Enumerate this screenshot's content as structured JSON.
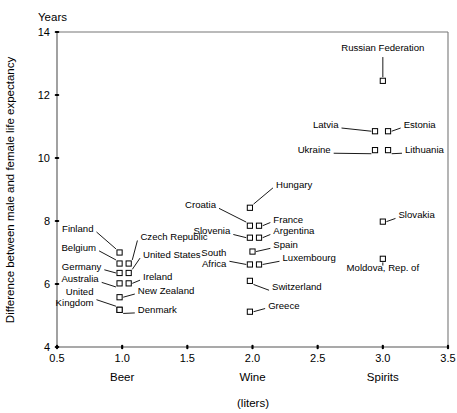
{
  "chart_data": {
    "type": "scatter",
    "title": "",
    "ylabel": "Difference between male and female life expectancy",
    "yunit": "Years",
    "xlabel": "",
    "xunit": "(liters)",
    "xlim": [
      0.5,
      3.5
    ],
    "ylim": [
      4,
      14
    ],
    "xticks": [
      "0.5",
      "1.0",
      "1.5",
      "2.0",
      "2.5",
      "3.0",
      "3.5"
    ],
    "xtickvals": [
      0.5,
      1.0,
      1.5,
      2.0,
      2.5,
      3.0,
      3.5
    ],
    "yticks": [
      "4",
      "6",
      "8",
      "10",
      "12",
      "14"
    ],
    "ytickvals": [
      4,
      6,
      8,
      10,
      12,
      14
    ],
    "grid": false,
    "legend": false,
    "category_labels": [
      {
        "text": "Beer",
        "x": 1.0
      },
      {
        "text": "Wine",
        "x": 2.0
      },
      {
        "text": "Spirits",
        "x": 3.0
      }
    ],
    "points": [
      {
        "name": "Russian Federation",
        "x": 3.0,
        "y": 12.45,
        "label_x": 3.0,
        "label_y": 13.3,
        "anchor": "middle",
        "leader": "v"
      },
      {
        "name": "Latvia",
        "x": 2.94,
        "y": 10.85,
        "label_x": 2.66,
        "label_y": 10.85,
        "anchor": "end",
        "leader": "h"
      },
      {
        "name": "Estonia",
        "x": 3.04,
        "y": 10.85,
        "label_x": 3.16,
        "label_y": 10.85,
        "anchor": "start",
        "leader": "h"
      },
      {
        "name": "Ukraine",
        "x": 2.94,
        "y": 10.25,
        "label_x": 2.6,
        "label_y": 10.05,
        "anchor": "end",
        "leader": "d"
      },
      {
        "name": "Lithuania",
        "x": 3.04,
        "y": 10.25,
        "label_x": 3.17,
        "label_y": 10.05,
        "anchor": "start",
        "leader": "d"
      },
      {
        "name": "Slovakia",
        "x": 3.0,
        "y": 7.98,
        "label_x": 3.12,
        "label_y": 7.98,
        "anchor": "start",
        "leader": "h"
      },
      {
        "name": "Moldova, Rep. of",
        "x": 3.0,
        "y": 6.8,
        "label_x": 3.0,
        "label_y": 6.3,
        "anchor": "middle",
        "leader": "v"
      },
      {
        "name": "Hungary",
        "x": 1.98,
        "y": 8.42,
        "label_x": 2.18,
        "label_y": 8.95,
        "anchor": "start",
        "leader": "d"
      },
      {
        "name": "Croatia",
        "x": 1.98,
        "y": 7.85,
        "label_x": 1.72,
        "label_y": 8.3,
        "anchor": "end",
        "leader": "d"
      },
      {
        "name": "France",
        "x": 2.05,
        "y": 7.85,
        "label_x": 2.16,
        "label_y": 7.85,
        "anchor": "start",
        "leader": "h"
      },
      {
        "name": "Slovenia",
        "x": 1.98,
        "y": 7.47,
        "label_x": 1.83,
        "label_y": 7.47,
        "anchor": "end",
        "leader": "h"
      },
      {
        "name": "Argentina",
        "x": 2.05,
        "y": 7.47,
        "label_x": 2.16,
        "label_y": 7.47,
        "anchor": "start",
        "leader": "h"
      },
      {
        "name": "Spain",
        "x": 2.0,
        "y": 7.03,
        "label_x": 2.16,
        "label_y": 7.03,
        "anchor": "start",
        "leader": "h"
      },
      {
        "name": "South Africa",
        "x": 1.98,
        "y": 6.62,
        "label_x": 1.8,
        "label_y": 6.62,
        "anchor": "end",
        "leader": "h"
      },
      {
        "name": "Luxembourg",
        "x": 2.05,
        "y": 6.62,
        "label_x": 2.23,
        "label_y": 6.62,
        "anchor": "start",
        "leader": "h"
      },
      {
        "name": "Switzerland",
        "x": 1.98,
        "y": 6.1,
        "label_x": 2.15,
        "label_y": 5.7,
        "anchor": "start",
        "leader": "d"
      },
      {
        "name": "Greece",
        "x": 1.98,
        "y": 5.12,
        "label_x": 2.12,
        "label_y": 5.12,
        "anchor": "start",
        "leader": "h"
      },
      {
        "name": "Finland",
        "x": 0.98,
        "y": 7.0,
        "label_x": 0.78,
        "label_y": 7.55,
        "anchor": "end",
        "leader": "d"
      },
      {
        "name": "Czech Republic",
        "x": 1.05,
        "y": 6.65,
        "label_x": 1.14,
        "label_y": 7.28,
        "anchor": "start",
        "leader": "d"
      },
      {
        "name": "Belgium",
        "x": 0.98,
        "y": 6.65,
        "label_x": 0.8,
        "label_y": 6.95,
        "anchor": "end",
        "leader": "d"
      },
      {
        "name": "United States",
        "x": 1.05,
        "y": 6.35,
        "label_x": 1.16,
        "label_y": 6.72,
        "anchor": "start",
        "leader": "d"
      },
      {
        "name": "Germany",
        "x": 0.98,
        "y": 6.35,
        "label_x": 0.84,
        "label_y": 6.35,
        "anchor": "end",
        "leader": "h"
      },
      {
        "name": "Ireland",
        "x": 1.05,
        "y": 6.02,
        "label_x": 1.16,
        "label_y": 6.02,
        "anchor": "start",
        "leader": "h"
      },
      {
        "name": "Australia",
        "x": 0.98,
        "y": 6.02,
        "label_x": 0.82,
        "label_y": 5.95,
        "anchor": "end",
        "leader": "d"
      },
      {
        "name": "New Zealand",
        "x": 0.98,
        "y": 5.58,
        "label_x": 1.12,
        "label_y": 5.58,
        "anchor": "start",
        "leader": "h"
      },
      {
        "name": "United Kingdom",
        "x": 0.98,
        "y": 5.18,
        "label_x": 0.78,
        "label_y": 5.4,
        "anchor": "end",
        "leader": "d"
      },
      {
        "name": "Denmark",
        "x": 0.98,
        "y": 5.18,
        "label_x": 1.12,
        "label_y": 4.98,
        "anchor": "start",
        "leader": "d"
      }
    ]
  }
}
